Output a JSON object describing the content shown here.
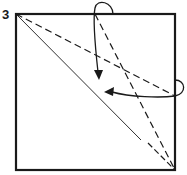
{
  "diagram": {
    "step_number": "3",
    "colors": {
      "line": "#1a1a1a",
      "background": "#ffffff"
    },
    "elements": [
      {
        "type": "square",
        "name": "paper"
      },
      {
        "type": "solid-line",
        "name": "diagonal-crease"
      },
      {
        "type": "dashed-line",
        "name": "valley-fold-line-1"
      },
      {
        "type": "dash-dot-line",
        "name": "valley-fold-line-2"
      },
      {
        "type": "arrow",
        "name": "fold-arrow-top"
      },
      {
        "type": "arrow",
        "name": "fold-arrow-right"
      }
    ]
  }
}
